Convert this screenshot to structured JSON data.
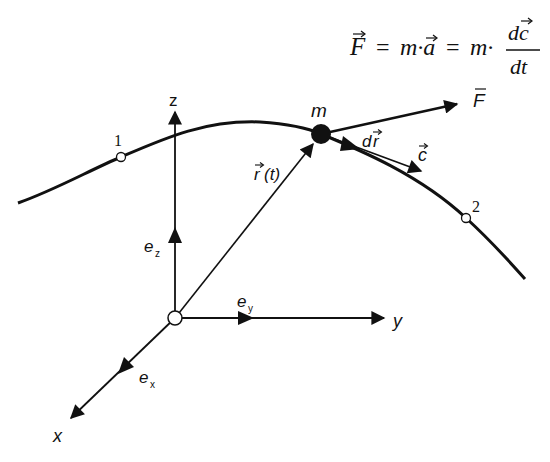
{
  "diagram": {
    "type": "kinematics-trajectory",
    "equation": {
      "lhs": "F",
      "mid": "m·a",
      "rhs_prefix": "m·",
      "numerator": "dc",
      "denominator": "dt",
      "eq1": "=",
      "eq2": "="
    },
    "axes": {
      "x_label": "x",
      "y_label": "y",
      "z_label": "z",
      "unit_vectors": {
        "ex": {
          "base": "e",
          "sub": "x"
        },
        "ey": {
          "base": "e",
          "sub": "y"
        },
        "ez": {
          "base": "e",
          "sub": "z"
        }
      }
    },
    "mass_label": "m",
    "force_label": "F",
    "position_label": {
      "base": "r",
      "arg": "(t)"
    },
    "displacement_label": {
      "d": "d",
      "r": "r"
    },
    "velocity_label": "c",
    "points": [
      {
        "label": "1"
      },
      {
        "label": "2"
      }
    ],
    "colors": {
      "stroke": "#111111",
      "background": "#ffffff"
    }
  }
}
